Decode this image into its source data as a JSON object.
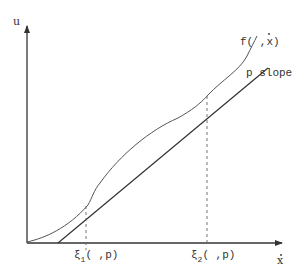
{
  "diagram": {
    "type": "tangent-line-to-curve",
    "axes": {
      "y_label": "u",
      "x_label": "x",
      "x_label_accent": "dot"
    },
    "curve": {
      "label_prefix": "f(",
      "label_sep": " ,",
      "label_var": "x",
      "label_suffix": ")"
    },
    "line": {
      "label": "p slope"
    },
    "tangent_points": [
      {
        "symbol": "ξ",
        "subscript": "1",
        "args": "( ,p)"
      },
      {
        "symbol": "ξ",
        "subscript": "2",
        "args": "( ,p)"
      }
    ],
    "colors": {
      "ink": "#333333",
      "curve": "#555555",
      "dashed": "#666666",
      "background": "#ffffff"
    }
  }
}
